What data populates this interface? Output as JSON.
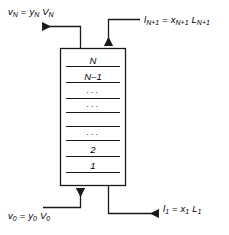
{
  "figure": {
    "type": "process-flow-diagram",
    "background_color": "#ffffff",
    "line_color": "#1a1a1a"
  },
  "column": {
    "name": "staged-column",
    "x": 60,
    "y": 48,
    "width": 66,
    "height": 138,
    "stage_labels": [
      {
        "id": "stage-N",
        "text": "N",
        "kind": "stage"
      },
      {
        "id": "stage-N-1",
        "text": "N–1",
        "kind": "stage"
      },
      {
        "id": "stage-dots-1",
        "text": "···",
        "kind": "dots"
      },
      {
        "id": "stage-dots-2",
        "text": "···",
        "kind": "dots"
      },
      {
        "id": "stage-dots-3",
        "text": "···",
        "kind": "dots"
      },
      {
        "id": "stage-2",
        "text": "2",
        "kind": "stage"
      },
      {
        "id": "stage-1",
        "text": "1",
        "kind": "stage"
      }
    ],
    "tray_line_count": 8
  },
  "streams": {
    "vapor_out_top": {
      "name": "vapor-outlet-top",
      "direction": "left",
      "equation": {
        "lhs_symbol": "v",
        "lhs_sub": "N",
        "operator": "=",
        "rhs_symbol_1": "y",
        "rhs_sub_1": "N",
        "rhs_symbol_2": "V",
        "rhs_sub_2": "N",
        "plain": "vN = yN VN"
      }
    },
    "liquid_in_top": {
      "name": "liquid-inlet-top",
      "direction": "down",
      "equation": {
        "lhs_symbol": "l",
        "lhs_sub": "N+1",
        "operator": "=",
        "rhs_symbol_1": "x",
        "rhs_sub_1": "N+1",
        "rhs_symbol_2": "L",
        "rhs_sub_2": "N+1",
        "plain": "lN+1 = xN+1 LN+1"
      }
    },
    "vapor_in_bottom": {
      "name": "vapor-inlet-bottom",
      "direction": "up",
      "equation": {
        "lhs_symbol": "v",
        "lhs_sub": "0",
        "operator": "=",
        "rhs_symbol_1": "y",
        "rhs_sub_1": "0",
        "rhs_symbol_2": "V",
        "rhs_sub_2": "0",
        "plain": "v0 = y0 V0"
      }
    },
    "liquid_out_bottom": {
      "name": "liquid-outlet-bottom",
      "direction": "right",
      "equation": {
        "lhs_symbol": "l",
        "lhs_sub": "1",
        "operator": "=",
        "rhs_symbol_1": "x",
        "rhs_sub_1": "1",
        "rhs_symbol_2": "L",
        "rhs_sub_2": "1",
        "plain": "l1 = x1 L1"
      }
    }
  }
}
